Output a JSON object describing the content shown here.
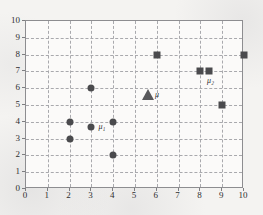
{
  "chart_data": {
    "type": "scatter",
    "title": "",
    "xlabel": "",
    "ylabel": "",
    "xlim": [
      0,
      10
    ],
    "ylim": [
      0,
      10
    ],
    "grid": true,
    "legend": "none",
    "xticks": [
      "0",
      "1",
      "2",
      "3",
      "4",
      "5",
      "6",
      "7",
      "8",
      "9",
      "10"
    ],
    "yticks": [
      "0",
      "1",
      "2",
      "3",
      "4",
      "5",
      "6",
      "7",
      "8",
      "9",
      "10"
    ],
    "series": [
      {
        "name": "cluster-1-points",
        "marker": "circle",
        "color": "#4a4a4d",
        "points": [
          {
            "x": 2,
            "y": 3
          },
          {
            "x": 2,
            "y": 4
          },
          {
            "x": 3,
            "y": 6
          },
          {
            "x": 4,
            "y": 2
          },
          {
            "x": 4,
            "y": 4
          }
        ]
      },
      {
        "name": "cluster-2-points",
        "marker": "square",
        "color": "#4a4a4d",
        "points": [
          {
            "x": 6,
            "y": 8
          },
          {
            "x": 8,
            "y": 7
          },
          {
            "x": 9,
            "y": 5
          },
          {
            "x": 10,
            "y": 8
          }
        ]
      },
      {
        "name": "centroids",
        "marker": "mixed",
        "color": "#4a4a4d",
        "points": [
          {
            "x": 3,
            "y": 3.7,
            "marker": "circle",
            "label": "μ",
            "sublabel": "1"
          },
          {
            "x": 8.4,
            "y": 7,
            "marker": "square",
            "label": "μ",
            "sublabel": "2"
          },
          {
            "x": 5.6,
            "y": 5.6,
            "marker": "triangle",
            "label": "μ",
            "sublabel": ""
          }
        ]
      }
    ],
    "annotations": [
      {
        "text": "μ₁",
        "x": 3,
        "y": 3.7,
        "placement": "right"
      },
      {
        "text": "μ₂",
        "x": 8.4,
        "y": 7,
        "placement": "below-right"
      },
      {
        "text": "μ",
        "x": 5.6,
        "y": 5.6,
        "placement": "right"
      }
    ]
  }
}
